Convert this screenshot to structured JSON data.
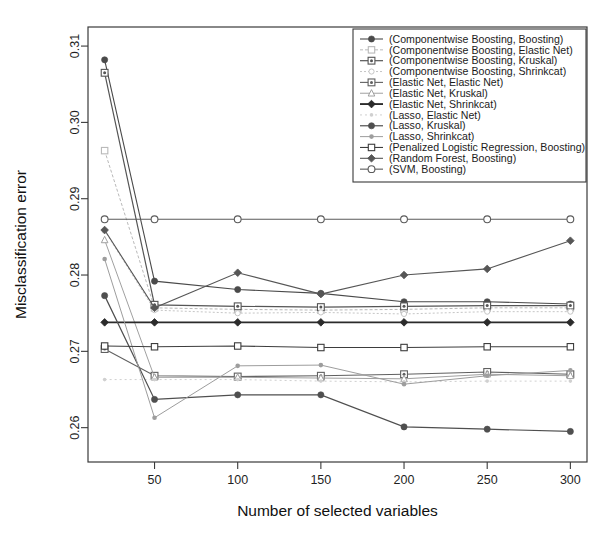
{
  "chart_data": {
    "type": "line",
    "title": "",
    "xlabel": "Number of selected variables",
    "ylabel": "Misclassification error",
    "x": [
      20,
      50,
      100,
      150,
      200,
      250,
      300
    ],
    "xlim": [
      10,
      310
    ],
    "ylim": [
      0.2555,
      0.3125
    ],
    "xticks": [
      50,
      100,
      150,
      200,
      250,
      300
    ],
    "xtick_labels": [
      "50",
      "100",
      "150",
      "200",
      "250",
      "300"
    ],
    "yticks": [
      0.26,
      0.27,
      0.28,
      0.29,
      0.3,
      0.31
    ],
    "ytick_labels": [
      "0.26",
      "0.27",
      "0.28",
      "0.29",
      "0.30",
      "0.31"
    ],
    "grid": false,
    "legend_position": "top-right",
    "series": [
      {
        "name": "(Componentwise Boosting, Boosting)",
        "marker": "solid-circle",
        "color": "#4a4a4a",
        "width": 1.1,
        "dash": "",
        "values": [
          0.3082,
          0.2792,
          0.2781,
          0.2776,
          0.2765,
          0.2765,
          0.2762
        ]
      },
      {
        "name": "(Componentwise Boosting, Elastic Net)",
        "marker": "open-square",
        "color": "#b9b9b9",
        "width": 1.0,
        "dash": "3,2",
        "values": [
          0.2963,
          0.2757,
          0.2755,
          0.2754,
          0.2755,
          0.2757,
          0.2757
        ]
      },
      {
        "name": "(Componentwise Boosting, Kruskal)",
        "marker": "dot-square",
        "color": "#555555",
        "width": 1.2,
        "dash": "",
        "values": [
          0.3065,
          0.2761,
          0.2759,
          0.2758,
          0.2759,
          0.276,
          0.276
        ]
      },
      {
        "name": "(Componentwise Boosting, Shrinkcat)",
        "marker": "open-circle-small",
        "color": "#c6c6c6",
        "width": 1.0,
        "dash": "2,2",
        "values": [
          0.2858,
          0.2754,
          0.275,
          0.2751,
          0.2749,
          0.2752,
          0.2752
        ]
      },
      {
        "name": "(Elastic Net, Elastic Net)",
        "marker": "dot-square",
        "color": "#606060",
        "width": 1.1,
        "dash": "",
        "values": [
          0.2703,
          0.2668,
          0.2667,
          0.2668,
          0.267,
          0.2673,
          0.267
        ]
      },
      {
        "name": "(Elastic Net, Kruskal)",
        "marker": "small-triangle",
        "color": "#a0a0a0",
        "width": 1.0,
        "dash": "",
        "values": [
          0.2846,
          0.2666,
          0.2666,
          0.2665,
          0.2664,
          0.267,
          0.2668
        ]
      },
      {
        "name": "(Elastic Net, Shrinkcat)",
        "marker": "solid-diamond",
        "color": "#2b2b2b",
        "width": 1.9,
        "dash": "",
        "values": [
          0.2738,
          0.2738,
          0.2738,
          0.2738,
          0.2738,
          0.2738,
          0.2738
        ]
      },
      {
        "name": "(Lasso, Elastic Net)",
        "marker": "tiny-dot",
        "color": "#d0d0d0",
        "width": 1.0,
        "dash": "2,3",
        "values": [
          0.2663,
          0.2663,
          0.2663,
          0.2661,
          0.266,
          0.2661,
          0.2661
        ]
      },
      {
        "name": "(Lasso, Kruskal)",
        "marker": "solid-circle",
        "color": "#4f4f4f",
        "width": 1.2,
        "dash": "",
        "values": [
          0.2773,
          0.2637,
          0.2643,
          0.2643,
          0.2601,
          0.2598,
          0.2595
        ]
      },
      {
        "name": "(Lasso, Shrinkcat)",
        "marker": "small-dot",
        "color": "#9d9d9d",
        "width": 1.0,
        "dash": "",
        "values": [
          0.2821,
          0.2613,
          0.2681,
          0.2682,
          0.2657,
          0.2668,
          0.2675
        ]
      },
      {
        "name": "(Penalized Logistic Regression, Boosting)",
        "marker": "open-square",
        "color": "#3d3d3d",
        "width": 1.1,
        "dash": "",
        "values": [
          0.2707,
          0.2706,
          0.2707,
          0.2705,
          0.2705,
          0.2706,
          0.2706
        ]
      },
      {
        "name": "(Random Forest, Boosting)",
        "marker": "solid-diamond",
        "color": "#565656",
        "width": 1.1,
        "dash": "",
        "values": [
          0.2859,
          0.2757,
          0.2803,
          0.2775,
          0.28,
          0.2808,
          0.2845
        ]
      },
      {
        "name": "(SVM, Boosting)",
        "marker": "open-circle",
        "color": "#5a5a5a",
        "width": 1.1,
        "dash": "",
        "values": [
          0.2873,
          0.2873,
          0.2873,
          0.2873,
          0.2873,
          0.2873,
          0.2873
        ]
      }
    ]
  },
  "legend": {
    "entries": [
      "(Componentwise Boosting, Boosting)",
      "(Componentwise Boosting, Elastic Net)",
      "(Componentwise Boosting, Kruskal)",
      "(Componentwise Boosting, Shrinkcat)",
      "(Elastic Net, Elastic Net)",
      "(Elastic Net, Kruskal)",
      "(Elastic Net, Shrinkcat)",
      "(Lasso, Elastic Net)",
      "(Lasso, Kruskal)",
      "(Lasso, Shrinkcat)",
      "(Penalized Logistic Regression, Boosting)",
      "(Random Forest, Boosting)",
      "(SVM, Boosting)"
    ]
  }
}
